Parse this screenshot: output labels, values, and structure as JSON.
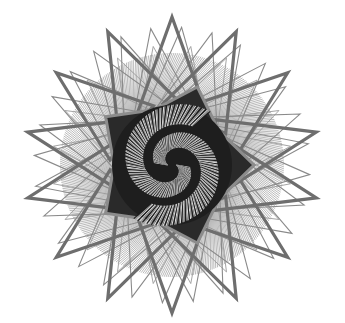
{
  "artwork": {
    "type": "generative-rosette",
    "width": 345,
    "height": 323,
    "background": "#ffffff",
    "center": [
      172,
      165
    ],
    "outer_triangles": {
      "thick": {
        "count": 14,
        "radius": 148,
        "stroke": "#6e6e6e",
        "width": 3.2,
        "angle_offset": 0
      },
      "thin": {
        "count": 28,
        "radius": 138,
        "stroke": "#8a8a8a",
        "width": 1.1,
        "angle_offset": 4
      },
      "mid_thin": {
        "count": 20,
        "radius": 120,
        "stroke": "#9a9a9a",
        "width": 0.9,
        "angle_offset": 9
      }
    },
    "hatch_band": {
      "inner": 58,
      "outer": 112,
      "lines": 360,
      "stroke": "#2b2b2b",
      "width": 0.6
    },
    "inner_star": {
      "points": 5,
      "outer_r": 82,
      "inner_r": 58,
      "stroke": "#8c8c8c",
      "width": 3,
      "fill": "#2a2a2a"
    },
    "swirl": {
      "arms": 2,
      "inner_r": 4,
      "outer_r": 60,
      "rays": 220,
      "dark": "#1e1e1e",
      "light": "#d9d9d9"
    }
  }
}
